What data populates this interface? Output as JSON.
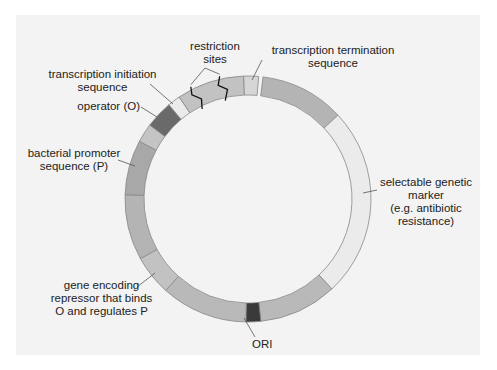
{
  "diagram": {
    "type": "plasmid-map",
    "center": [
      248,
      199
    ],
    "outer_radius": 123,
    "inner_radius": 104,
    "colors": {
      "panel": "#f3f3f3",
      "medium_gray": "#b4b4b4",
      "light_gray": "#cdcdcd",
      "pale": "#ebebeb",
      "dark_gray": "#6a6a6a",
      "ori": "#3a3a3a",
      "stroke": "#888888"
    },
    "segments": [
      {
        "name": "region-after-termination",
        "start": 7,
        "end": 47,
        "fill": "#b4b4b4"
      },
      {
        "name": "selectable-genetic-marker",
        "start": 47,
        "end": 137,
        "fill": "#ebebeb"
      },
      {
        "name": "bottom-right-region",
        "start": 137,
        "end": 174,
        "fill": "#b9b9b9"
      },
      {
        "name": "ori",
        "start": 174,
        "end": 181,
        "fill": "#3a3a3a"
      },
      {
        "name": "bottom-left-region",
        "start": 181,
        "end": 222,
        "fill": "#b9b9b9"
      },
      {
        "name": "repressor-gene",
        "start": 222,
        "end": 241,
        "fill": "#c2c2c2"
      },
      {
        "name": "left-region",
        "start": 241,
        "end": 272,
        "fill": "#b4b4b4"
      },
      {
        "name": "bacterial-promoter",
        "start": 272,
        "end": 298,
        "fill": "#a8a8a8"
      },
      {
        "name": "promoter-upper",
        "start": 298,
        "end": 307,
        "fill": "#c4c4c4"
      },
      {
        "name": "operator",
        "start": 307,
        "end": 320,
        "fill": "#6a6a6a"
      },
      {
        "name": "transcription-initiation",
        "start": 320,
        "end": 326,
        "fill": "#ebebeb"
      },
      {
        "name": "cloning-region",
        "start": 326,
        "end": 358,
        "fill": "#c2c2c2"
      },
      {
        "name": "transcription-termination",
        "start": 358,
        "end": 365,
        "fill": "#d6d6d6"
      }
    ],
    "labels": {
      "restriction_sites": [
        "restriction",
        "sites"
      ],
      "termination": [
        "transcription termination",
        "sequence"
      ],
      "initiation": [
        "transcription initiation",
        "sequence"
      ],
      "operator": "operator (O)",
      "promoter": [
        "bacterial promoter",
        "sequence (P)"
      ],
      "marker": [
        "selectable genetic",
        "marker",
        "(e.g. antibiotic",
        "resistance)"
      ],
      "repressor": [
        "gene encoding",
        "repressor that binds",
        "O and regulates P"
      ],
      "ori": "ORI"
    }
  }
}
